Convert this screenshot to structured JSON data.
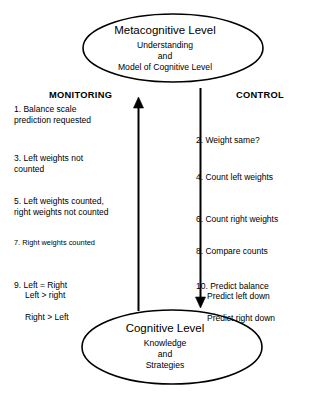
{
  "nodes": {
    "metacognitive": {
      "title": "Metacognitive Level",
      "line1": "Understanding",
      "line2": "and",
      "line3": "Model of Cognitive Level"
    },
    "cognitive": {
      "title": "Cognitive Level",
      "line1": "Knowledge",
      "line2": "and",
      "line3": "Strategies"
    }
  },
  "columns": {
    "monitoring": {
      "header": "MONITORING",
      "steps": [
        {
          "id": "step-1",
          "text": "1.  Balance scale\nprediction requested"
        },
        {
          "id": "step-3",
          "text": "3. Left weights not\ncounted"
        },
        {
          "id": "step-5",
          "text": "5. Left weights counted,\nright weights not counted"
        },
        {
          "id": "step-7",
          "text": "7. Right weights counted"
        },
        {
          "id": "step-9",
          "first": "9. Left = Right",
          "cont1": "Left > right",
          "cont2": "Right > Left"
        }
      ]
    },
    "control": {
      "header": "CONTROL",
      "steps": [
        {
          "id": "step-2",
          "text": "2. Weight same?"
        },
        {
          "id": "step-4",
          "text": "4. Count left weights"
        },
        {
          "id": "step-6",
          "text": "6. Count right weights"
        },
        {
          "id": "step-8",
          "text": "8. Compare counts"
        },
        {
          "id": "step-10",
          "first": "10. Predict balance",
          "cont1": "Predict left down",
          "cont2": "Predict right down"
        }
      ]
    }
  },
  "arrows": {
    "monitoring_arrow": {
      "direction": "up",
      "label": "monitoring flow from Cognitive Level to Metacognitive Level"
    },
    "control_arrow": {
      "direction": "down",
      "label": "control flow from Metacognitive Level to Cognitive Level"
    }
  },
  "colors": {
    "background": "#ffffff",
    "ink": "#000000"
  }
}
